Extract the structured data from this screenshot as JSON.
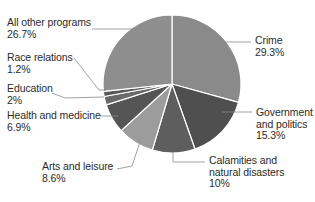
{
  "chart_data": {
    "type": "pie",
    "title": "",
    "start_angle_deg": 0,
    "direction": "clockwise",
    "slices": [
      {
        "label": "Crime",
        "value": 29.3,
        "display": "29.3%",
        "color": "#8a8a8a"
      },
      {
        "label": "Government and politics",
        "value": 15.3,
        "display": "15.3%",
        "color": "#4f4f4f"
      },
      {
        "label": "Calamities and natural disasters",
        "value": 10,
        "display": "10%",
        "color": "#5e5e5e"
      },
      {
        "label": "Arts and leisure",
        "value": 8.6,
        "display": "8.6%",
        "color": "#9c9c9c"
      },
      {
        "label": "Health and medicine",
        "value": 6.9,
        "display": "6.9%",
        "color": "#555555"
      },
      {
        "label": "Education",
        "value": 2,
        "display": "2%",
        "color": "#6a6a6a"
      },
      {
        "label": "Race relations",
        "value": 1.2,
        "display": "1.2%",
        "color": "#5a5a5a"
      },
      {
        "label": "All other programs",
        "value": 26.7,
        "display": "26.7%",
        "color": "#8e8e8e"
      }
    ],
    "legend": "none (leader-line labels)"
  },
  "labels": {
    "crime": {
      "line1": "Crime",
      "pct": "29.3%"
    },
    "government": {
      "line1": "Government",
      "line2": "and politics",
      "pct": "15.3%"
    },
    "calamities": {
      "line1": "Calamities and",
      "line2": "natural disasters",
      "pct": "10%"
    },
    "arts": {
      "line1": "Arts and leisure",
      "pct": "8.6%"
    },
    "health": {
      "line1": "Health and medicine",
      "pct": "6.9%"
    },
    "education": {
      "line1": "Education",
      "pct": "2%"
    },
    "race": {
      "line1": "Race relations",
      "pct": "1.2%"
    },
    "other": {
      "line1": "All other programs",
      "pct": "26.7%"
    }
  }
}
